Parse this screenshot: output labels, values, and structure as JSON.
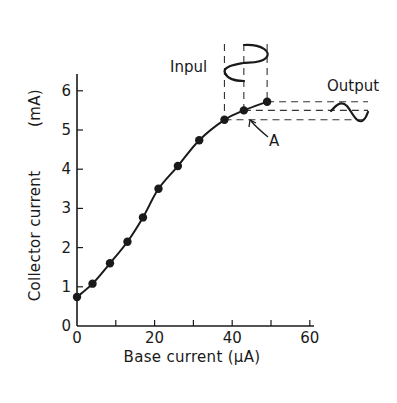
{
  "chart_data": {
    "type": "line",
    "title": "",
    "xlabel": "Base current (μA)",
    "ylabel": "Collector current",
    "ylabel_unit": "(mA)",
    "xlim": [
      0,
      60
    ],
    "ylim": [
      0,
      6
    ],
    "xticks": [
      0,
      10,
      20,
      30,
      40,
      50,
      60
    ],
    "xtick_labels": [
      "0",
      "20",
      "40",
      "60"
    ],
    "xtick_label_values": [
      0,
      20,
      40,
      60
    ],
    "yticks": [
      0,
      1,
      2,
      3,
      4,
      5,
      6
    ],
    "ytick_labels": [
      "0",
      "1",
      "2",
      "3",
      "4",
      "5",
      "6"
    ],
    "grid": false,
    "series": [
      {
        "name": "Transfer characteristic",
        "markers": true,
        "x": [
          0,
          4,
          8.5,
          13,
          17,
          21,
          26,
          31.5,
          38,
          43,
          49
        ],
        "y": [
          0.74,
          1.08,
          1.6,
          2.15,
          2.77,
          3.5,
          4.08,
          4.74,
          5.26,
          5.5,
          5.72
        ]
      }
    ],
    "annotations": {
      "input_label": "Inpul",
      "output_label": "Output",
      "point_label": "A",
      "point_label_target": {
        "x": 43,
        "y": 5.5
      },
      "input_swing_x": [
        38,
        43,
        49
      ],
      "output_swing_y": [
        5.26,
        5.5,
        5.72
      ]
    }
  }
}
